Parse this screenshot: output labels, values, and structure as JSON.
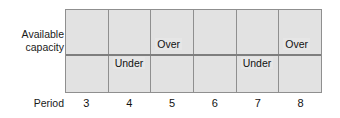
{
  "chart_data": {
    "type": "bar",
    "title": "",
    "subtitle": "",
    "xlabel": "Period",
    "ylabel": "Available capacity",
    "categories": [
      "3",
      "4",
      "5",
      "6",
      "7",
      "8"
    ],
    "series": [
      {
        "name": "Capacity status",
        "values": [
          "",
          "Under",
          "Over",
          "",
          "Under",
          "Over"
        ]
      }
    ],
    "annotations": [
      {
        "period": "3",
        "label": "",
        "position": ""
      },
      {
        "period": "4",
        "label": "Under",
        "position": "below-capacity-line"
      },
      {
        "period": "5",
        "label": "Over",
        "position": "above-capacity-line"
      },
      {
        "period": "6",
        "label": "",
        "position": ""
      },
      {
        "period": "7",
        "label": "Under",
        "position": "below-capacity-line"
      },
      {
        "period": "8",
        "label": "Over",
        "position": "above-capacity-line"
      }
    ],
    "reference_line": {
      "name": "Available capacity",
      "orientation": "horizontal"
    },
    "grid": true,
    "legend": "none",
    "colors": {
      "plot_fill": "#e2e2e2",
      "grid_line": "#8f8f8f",
      "reference_line": "#7e7e7e",
      "text": "#111111",
      "background": "#ffffff"
    }
  },
  "axes": {
    "y_label_lines": [
      "Available",
      "capacity"
    ],
    "x_label": "Period",
    "x_ticks": [
      "3",
      "4",
      "5",
      "6",
      "7",
      "8"
    ]
  },
  "cells": [
    {
      "label": "",
      "kind": "none"
    },
    {
      "label": "Under",
      "kind": "under"
    },
    {
      "label": "Over",
      "kind": "over"
    },
    {
      "label": "",
      "kind": "none"
    },
    {
      "label": "Under",
      "kind": "under"
    },
    {
      "label": "Over",
      "kind": "over"
    }
  ]
}
